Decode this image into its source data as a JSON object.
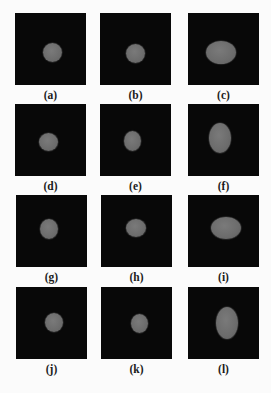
{
  "figure": {
    "panel_background": "#080808",
    "blob_color": "#6e6e6e",
    "panels": [
      {
        "label": "(a)",
        "x": 15,
        "y": 13,
        "blob": {
          "cx": 37,
          "cy": 39,
          "rx": 9.5,
          "ry": 9.5
        }
      },
      {
        "label": "(b)",
        "x": 100,
        "y": 13,
        "blob": {
          "cx": 35,
          "cy": 40,
          "rx": 9.5,
          "ry": 9.5
        }
      },
      {
        "label": "(c)",
        "x": 188,
        "y": 13,
        "blob": {
          "cx": 33,
          "cy": 39,
          "rx": 15,
          "ry": 11.5
        }
      },
      {
        "label": "(d)",
        "x": 15,
        "y": 104,
        "blob": {
          "cx": 33,
          "cy": 38,
          "rx": 9.5,
          "ry": 9
        }
      },
      {
        "label": "(e)",
        "x": 100,
        "y": 104,
        "blob": {
          "cx": 32,
          "cy": 37,
          "rx": 8.5,
          "ry": 10
        }
      },
      {
        "label": "(f)",
        "x": 188,
        "y": 104,
        "blob": {
          "cx": 32,
          "cy": 34,
          "rx": 11,
          "ry": 15
        }
      },
      {
        "label": "(g)",
        "x": 16,
        "y": 195,
        "blob": {
          "cx": 33,
          "cy": 34,
          "rx": 9,
          "ry": 10
        }
      },
      {
        "label": "(h)",
        "x": 101,
        "y": 195,
        "blob": {
          "cx": 35,
          "cy": 33,
          "rx": 10,
          "ry": 9
        }
      },
      {
        "label": "(i)",
        "x": 188,
        "y": 195,
        "blob": {
          "cx": 38,
          "cy": 33,
          "rx": 15,
          "ry": 11
        }
      },
      {
        "label": "(j)",
        "x": 16,
        "y": 287,
        "blob": {
          "cx": 38,
          "cy": 35,
          "rx": 9,
          "ry": 9.5
        }
      },
      {
        "label": "(k)",
        "x": 101,
        "y": 287,
        "blob": {
          "cx": 38,
          "cy": 36,
          "rx": 8.5,
          "ry": 9.5
        }
      },
      {
        "label": "(l)",
        "x": 188,
        "y": 287,
        "blob": {
          "cx": 39,
          "cy": 36,
          "rx": 11,
          "ry": 16
        }
      }
    ]
  }
}
